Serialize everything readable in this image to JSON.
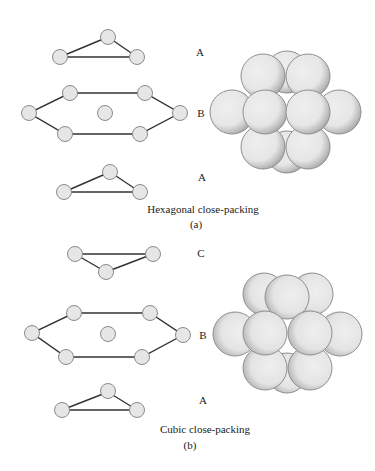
{
  "panel_a": {
    "layer_labels": [
      "A",
      "B",
      "A"
    ],
    "caption": "Hexagonal close-packing",
    "sublabel": "(a)"
  },
  "panel_b": {
    "layer_labels": [
      "C",
      "B",
      "A"
    ],
    "caption": "Cubic close-packing",
    "sublabel": "(b)"
  },
  "colors": {
    "node_fill": "#e6e6e6",
    "node_stroke": "#8a8a8a",
    "edge": "#333333",
    "sphere_fill": "#ececec",
    "sphere_stroke": "#8f8f8f",
    "stipple": "#555555"
  }
}
